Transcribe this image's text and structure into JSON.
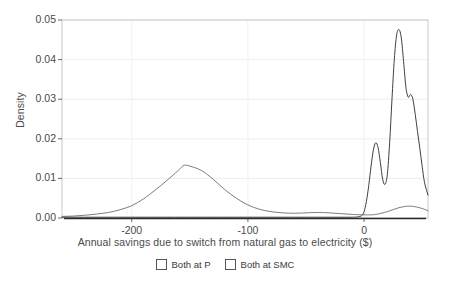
{
  "chart_data": {
    "type": "line",
    "title": "",
    "xlabel": "Annual savings due to switch from natural gas to electricity ($)",
    "ylabel": "Density",
    "xlim": [
      -260,
      55
    ],
    "ylim": [
      0,
      0.05
    ],
    "xticks": [
      -200,
      -100,
      0
    ],
    "xtick_labels": [
      "-200",
      "-100",
      "0"
    ],
    "yticks": [
      0.0,
      0.01,
      0.02,
      0.03,
      0.04,
      0.05
    ],
    "ytick_labels": [
      "0.00",
      "0.01",
      "0.02",
      "0.03",
      "0.04",
      "0.05"
    ],
    "grid": true,
    "legend_position": "bottom-center",
    "series": [
      {
        "name": "Both at P",
        "color": "#6e6e6e",
        "x": [
          -260,
          -250,
          -240,
          -230,
          -220,
          -210,
          -200,
          -190,
          -180,
          -170,
          -160,
          -155,
          -150,
          -140,
          -130,
          -120,
          -110,
          -100,
          -90,
          -80,
          -70,
          -60,
          -50,
          -40,
          -30,
          -20,
          -10,
          0,
          5,
          10,
          20,
          30,
          40,
          50,
          55
        ],
        "values": [
          0.0004,
          0.0005,
          0.0007,
          0.001,
          0.0014,
          0.0021,
          0.0031,
          0.0048,
          0.007,
          0.0094,
          0.012,
          0.0133,
          0.0131,
          0.012,
          0.0098,
          0.0072,
          0.005,
          0.0033,
          0.0022,
          0.0016,
          0.0013,
          0.0012,
          0.0013,
          0.0014,
          0.0013,
          0.0011,
          0.0009,
          0.0008,
          0.0008,
          0.0009,
          0.0016,
          0.0026,
          0.003,
          0.0024,
          0.0018
        ]
      },
      {
        "name": "Both at SMC",
        "color": "#3f3f3f",
        "x": [
          -260,
          -200,
          -150,
          -100,
          -60,
          -40,
          -20,
          -10,
          -5,
          -2,
          0,
          2,
          4,
          6,
          8,
          10,
          12,
          14,
          16,
          18,
          20,
          22,
          24,
          26,
          28,
          30,
          32,
          34,
          36,
          38,
          40,
          42,
          44,
          46,
          48,
          50,
          52,
          55
        ],
        "values": [
          0.0002,
          0.0002,
          0.0002,
          0.0002,
          0.0002,
          0.0002,
          0.0002,
          0.0002,
          0.0003,
          0.0006,
          0.0016,
          0.0042,
          0.0082,
          0.0131,
          0.0172,
          0.019,
          0.0178,
          0.014,
          0.0098,
          0.0085,
          0.011,
          0.019,
          0.03,
          0.04,
          0.0462,
          0.0476,
          0.0455,
          0.0395,
          0.033,
          0.0305,
          0.0312,
          0.03,
          0.0262,
          0.0218,
          0.0175,
          0.013,
          0.009,
          0.0058
        ]
      }
    ]
  },
  "axes": {
    "y_title": "Density",
    "x_title": "Annual savings due to switch from natural gas to electricity ($)"
  },
  "legend": {
    "items": [
      {
        "label": "Both at P"
      },
      {
        "label": "Both at SMC"
      }
    ]
  }
}
